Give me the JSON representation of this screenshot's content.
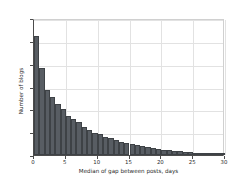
{
  "chart_data": {
    "type": "bar",
    "title": "",
    "subtitle": "",
    "xlabel": "Median of gap between posts, days",
    "ylabel": "Number of blogs",
    "xlim": [
      0,
      30
    ],
    "ylim": [
      0,
      12000
    ],
    "xticks": [
      0,
      5,
      10,
      15,
      20,
      25,
      30
    ],
    "xtick_labels": [
      "0",
      "5",
      "10",
      "15",
      "20",
      "25",
      "30"
    ],
    "yticks": [
      0,
      2000,
      4000,
      6000,
      8000,
      10000,
      12000
    ],
    "ytick_labels": [
      "0",
      "2000",
      "4000",
      "6000",
      "8000",
      "10000",
      "12000"
    ],
    "grid": true,
    "legend": null,
    "bar_color": "#585d63",
    "edge_color": "#3e4246",
    "bin_width": 0.8333,
    "x": [
      0.42,
      1.25,
      2.08,
      2.92,
      3.75,
      4.58,
      5.42,
      6.25,
      7.08,
      7.92,
      8.75,
      9.58,
      10.42,
      11.25,
      12.08,
      12.92,
      13.75,
      14.58,
      15.42,
      16.25,
      17.08,
      17.92,
      18.75,
      19.58,
      20.42,
      21.25,
      22.08,
      22.92,
      23.75,
      24.58,
      25.42,
      26.25,
      27.08,
      27.92,
      28.75,
      29.58
    ],
    "categories": [
      "0.0-0.8",
      "0.8-1.7",
      "1.7-2.5",
      "2.5-3.3",
      "3.3-4.2",
      "4.2-5.0",
      "5.0-5.8",
      "5.8-6.7",
      "6.7-7.5",
      "7.5-8.3",
      "8.3-9.2",
      "9.2-10.0",
      "10.0-10.8",
      "10.8-11.7",
      "11.7-12.5",
      "12.5-13.3",
      "13.3-14.2",
      "14.2-15.0",
      "15.0-15.8",
      "15.8-16.7",
      "16.7-17.5",
      "17.5-18.3",
      "18.3-19.2",
      "19.2-20.0",
      "20.0-20.8",
      "20.8-21.7",
      "21.7-22.5",
      "22.5-23.3",
      "23.3-24.2",
      "24.2-25.0",
      "25.0-25.8",
      "25.8-26.7",
      "26.7-27.5",
      "27.5-28.3",
      "28.3-29.2",
      "29.2-30.0"
    ],
    "values": [
      10400,
      7650,
      5700,
      5100,
      4450,
      4000,
      3400,
      3150,
      2850,
      2450,
      2200,
      1950,
      1800,
      1600,
      1450,
      1300,
      1150,
      1050,
      950,
      850,
      760,
      680,
      600,
      540,
      470,
      410,
      360,
      320,
      280,
      250,
      220,
      190,
      170,
      150,
      130,
      110
    ]
  }
}
